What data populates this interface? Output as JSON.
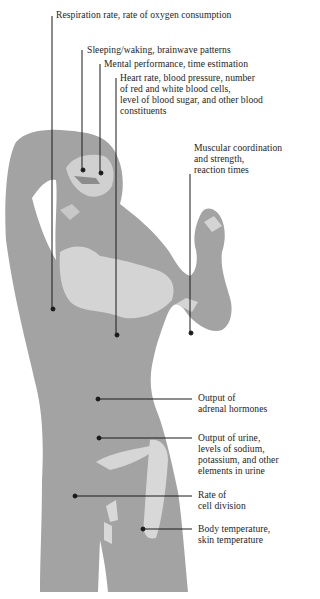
{
  "figure": {
    "colors": {
      "body": "#a3a3a3",
      "body_dark": "#8c8c8c",
      "highlight": "#d4d4d4",
      "line": "#1a1a1a",
      "background": "#ffffff"
    }
  },
  "labels": [
    {
      "id": "respiration",
      "text": "Respiration rate, rate of oxygen consumption"
    },
    {
      "id": "sleeping",
      "text": "Sleeping/waking, brainwave patterns"
    },
    {
      "id": "mental",
      "text": "Mental performance, time estimation"
    },
    {
      "id": "heart",
      "text": "Heart rate, blood pressure, number\nof red and white blood cells,\nlevel of blood sugar, and other blood\nconstituents"
    },
    {
      "id": "muscular",
      "text": "Muscular coordination\nand strength,\nreaction times"
    },
    {
      "id": "adrenal",
      "text": "Output of\nadrenal hormones"
    },
    {
      "id": "urine",
      "text": "Output of urine,\nlevels of sodium,\npotassium, and other\nelements in urine"
    },
    {
      "id": "cell",
      "text": "Rate of\ncell division"
    },
    {
      "id": "temperature",
      "text": "Body temperature,\nskin temperature"
    }
  ]
}
